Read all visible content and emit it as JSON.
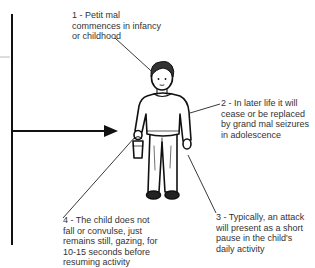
{
  "diagram": {
    "labels": [
      {
        "lines": [
          "1 - Petit mal",
          "commences in infancy",
          "or childhood"
        ]
      },
      {
        "lines": [
          "2 - In later life it will",
          "cease or be replaced",
          "by grand mal seizures",
          "in adolescence"
        ]
      },
      {
        "lines": [
          "3 - Typically, an attack",
          "will present as a short",
          "pause in the child's",
          "daily activity"
        ]
      },
      {
        "lines": [
          "4 - The child does not",
          "fall or convulse, just",
          "remains still, gazing, for",
          "10-15 seconds before",
          "resuming activity"
        ]
      }
    ],
    "figure": "child-standing-holding-bucket",
    "axis": {
      "vertical": "time-axis-line",
      "horizontal": "arrow-pointing-to-child"
    },
    "colors": {
      "ink": "#111111",
      "text": "#333333",
      "background": "#ffffff",
      "faint_line": "#bbbbbb"
    }
  }
}
